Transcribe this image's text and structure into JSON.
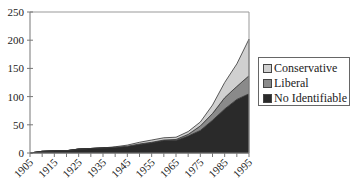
{
  "chart_data": {
    "type": "area",
    "stacked": true,
    "title": "",
    "xlabel": "",
    "ylabel": "",
    "x": [
      1905,
      1910,
      1915,
      1920,
      1925,
      1930,
      1935,
      1940,
      1945,
      1950,
      1955,
      1960,
      1965,
      1970,
      1975,
      1980,
      1985,
      1990,
      1995
    ],
    "x_tick_labels": [
      "1905",
      "1915",
      "1925",
      "1935",
      "1945",
      "1955",
      "1965",
      "1975",
      "1985",
      "1995"
    ],
    "y_ticks": [
      0,
      50,
      100,
      150,
      200,
      250
    ],
    "ylim": [
      0,
      250
    ],
    "xlim": [
      1905,
      1995
    ],
    "grid": false,
    "legend_position": "right",
    "series": [
      {
        "name": "No Identifiable",
        "color": "#2a2a2a",
        "values": [
          0,
          3,
          4,
          4,
          7,
          8,
          9,
          10,
          12,
          15,
          18,
          22,
          22,
          30,
          40,
          58,
          78,
          95,
          105
        ]
      },
      {
        "name": "Liberal",
        "color": "#8a8a8a",
        "values": [
          0,
          0,
          0,
          0,
          0,
          0,
          0,
          0,
          0,
          1,
          1,
          1,
          2,
          3,
          8,
          12,
          20,
          23,
          32
        ]
      },
      {
        "name": "Conservative",
        "color": "#d0d0d0",
        "values": [
          0,
          0,
          0,
          0,
          0,
          0,
          0,
          1,
          2,
          3,
          4,
          4,
          4,
          5,
          7,
          15,
          27,
          40,
          65
        ]
      }
    ]
  },
  "legend": {
    "items": [
      {
        "label": "Conservative",
        "color": "#d0d0d0"
      },
      {
        "label": "Liberal",
        "color": "#8a8a8a"
      },
      {
        "label": "No Identifiable",
        "color": "#2a2a2a"
      }
    ]
  }
}
